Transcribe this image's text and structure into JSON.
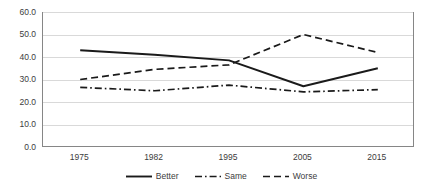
{
  "chart_data": {
    "type": "line",
    "title": "",
    "subtitle": "",
    "xlabel": "",
    "ylabel": "",
    "categories": [
      "1975",
      "1982",
      "1995",
      "2005",
      "2015"
    ],
    "ylim": [
      0,
      60
    ],
    "ytick_step": 10,
    "ytick_labels": [
      "60.0",
      "50.0",
      "40.0",
      "30.0",
      "20.0",
      "10.0",
      "0.0"
    ],
    "ytick_values": [
      60,
      50,
      40,
      30,
      20,
      10,
      0
    ],
    "grid": true,
    "legend_position": "bottom",
    "series": [
      {
        "name": "Better",
        "style": "solid",
        "color": "#1a1a1a",
        "values": [
          43.0,
          41.0,
          38.5,
          27.0,
          35.0
        ]
      },
      {
        "name": "Same",
        "style": "dash-dot",
        "color": "#1a1a1a",
        "values": [
          26.5,
          25.0,
          27.5,
          24.5,
          25.5
        ]
      },
      {
        "name": "Worse",
        "style": "dashed",
        "color": "#1a1a1a",
        "values": [
          30.0,
          34.5,
          36.5,
          50.0,
          42.0
        ]
      }
    ]
  },
  "axis_color": "#868686",
  "grid_color": "#d9d9d9"
}
